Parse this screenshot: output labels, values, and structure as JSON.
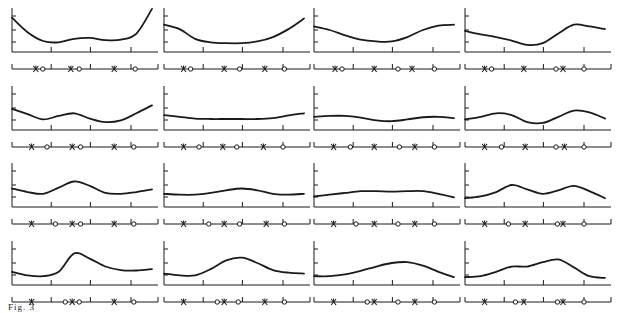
{
  "figure": {
    "caption": "Fig. 3",
    "ink_color": "#1a1a1a",
    "grid": {
      "rows": 4,
      "cols": 4
    }
  },
  "chart_data": {
    "type": "line",
    "title": "",
    "panels": [
      {
        "row": 0,
        "col": 0,
        "curve": [
          0.78,
          0.45,
          0.25,
          0.22,
          0.3,
          0.32,
          0.27,
          0.28,
          0.42,
          0.98
        ],
        "markers": [
          {
            "t": "x",
            "p": 0.17
          },
          {
            "t": "o",
            "p": 0.22
          },
          {
            "t": "x",
            "p": 0.42
          },
          {
            "t": "o",
            "p": 0.48
          },
          {
            "t": "x",
            "p": 0.73
          },
          {
            "t": "o",
            "p": 0.88
          }
        ]
      },
      {
        "row": 0,
        "col": 1,
        "curve": [
          0.62,
          0.52,
          0.3,
          0.22,
          0.2,
          0.2,
          0.24,
          0.34,
          0.52,
          0.76
        ],
        "markers": [
          {
            "t": "x",
            "p": 0.14
          },
          {
            "t": "o",
            "p": 0.19
          },
          {
            "t": "x",
            "p": 0.43
          },
          {
            "t": "o",
            "p": 0.54
          },
          {
            "t": "x",
            "p": 0.72
          },
          {
            "t": "o",
            "p": 0.86
          }
        ]
      },
      {
        "row": 0,
        "col": 2,
        "curve": [
          0.58,
          0.5,
          0.38,
          0.28,
          0.24,
          0.24,
          0.34,
          0.5,
          0.6,
          0.62
        ],
        "markers": [
          {
            "t": "x",
            "p": 0.15
          },
          {
            "t": "o",
            "p": 0.2
          },
          {
            "t": "x",
            "p": 0.43
          },
          {
            "t": "o",
            "p": 0.6
          },
          {
            "t": "x",
            "p": 0.7
          },
          {
            "t": "o",
            "p": 0.86
          }
        ]
      },
      {
        "row": 0,
        "col": 3,
        "curve": [
          0.48,
          0.4,
          0.34,
          0.26,
          0.16,
          0.2,
          0.42,
          0.62,
          0.58,
          0.52
        ],
        "markers": [
          {
            "t": "x",
            "p": 0.14
          },
          {
            "t": "o",
            "p": 0.19
          },
          {
            "t": "x",
            "p": 0.42
          },
          {
            "t": "o",
            "p": 0.65
          },
          {
            "t": "x",
            "p": 0.7
          },
          {
            "t": "o",
            "p": 0.85
          }
        ]
      },
      {
        "row": 1,
        "col": 0,
        "curve": [
          0.48,
          0.36,
          0.24,
          0.32,
          0.38,
          0.26,
          0.18,
          0.22,
          0.38,
          0.56
        ],
        "markers": [
          {
            "t": "x",
            "p": 0.14
          },
          {
            "t": "o",
            "p": 0.25
          },
          {
            "t": "x",
            "p": 0.43
          },
          {
            "t": "o",
            "p": 0.49
          },
          {
            "t": "x",
            "p": 0.73
          },
          {
            "t": "o",
            "p": 0.87
          }
        ]
      },
      {
        "row": 1,
        "col": 1,
        "curve": [
          0.34,
          0.3,
          0.26,
          0.25,
          0.25,
          0.25,
          0.25,
          0.27,
          0.33,
          0.38
        ],
        "markers": [
          {
            "t": "x",
            "p": 0.14
          },
          {
            "t": "o",
            "p": 0.25
          },
          {
            "t": "x",
            "p": 0.42
          },
          {
            "t": "o",
            "p": 0.52
          },
          {
            "t": "x",
            "p": 0.71
          },
          {
            "t": "o",
            "p": 0.85
          }
        ]
      },
      {
        "row": 1,
        "col": 2,
        "curve": [
          0.3,
          0.32,
          0.32,
          0.28,
          0.22,
          0.2,
          0.24,
          0.29,
          0.3,
          0.27
        ],
        "markers": [
          {
            "t": "x",
            "p": 0.14
          },
          {
            "t": "o",
            "p": 0.26
          },
          {
            "t": "x",
            "p": 0.43
          },
          {
            "t": "o",
            "p": 0.61
          },
          {
            "t": "x",
            "p": 0.72
          },
          {
            "t": "o",
            "p": 0.86
          }
        ]
      },
      {
        "row": 1,
        "col": 3,
        "curve": [
          0.24,
          0.3,
          0.38,
          0.34,
          0.18,
          0.16,
          0.3,
          0.44,
          0.4,
          0.26
        ],
        "markers": [
          {
            "t": "x",
            "p": 0.14
          },
          {
            "t": "o",
            "p": 0.26
          },
          {
            "t": "x",
            "p": 0.43
          },
          {
            "t": "o",
            "p": 0.65
          },
          {
            "t": "x",
            "p": 0.71
          },
          {
            "t": "o",
            "p": 0.85
          }
        ]
      },
      {
        "row": 2,
        "col": 0,
        "curve": [
          0.42,
          0.34,
          0.3,
          0.44,
          0.58,
          0.48,
          0.32,
          0.3,
          0.34,
          0.4
        ],
        "markers": [
          {
            "t": "x",
            "p": 0.14
          },
          {
            "t": "o",
            "p": 0.31
          },
          {
            "t": "x",
            "p": 0.43
          },
          {
            "t": "o",
            "p": 0.49
          },
          {
            "t": "x",
            "p": 0.73
          },
          {
            "t": "o",
            "p": 0.87
          }
        ]
      },
      {
        "row": 2,
        "col": 1,
        "curve": [
          0.3,
          0.28,
          0.28,
          0.32,
          0.38,
          0.42,
          0.38,
          0.3,
          0.28,
          0.3
        ],
        "markers": [
          {
            "t": "x",
            "p": 0.14
          },
          {
            "t": "o",
            "p": 0.32
          },
          {
            "t": "x",
            "p": 0.43
          },
          {
            "t": "o",
            "p": 0.54
          },
          {
            "t": "x",
            "p": 0.73
          },
          {
            "t": "o",
            "p": 0.86
          }
        ]
      },
      {
        "row": 2,
        "col": 2,
        "curve": [
          0.24,
          0.28,
          0.32,
          0.36,
          0.36,
          0.35,
          0.36,
          0.36,
          0.3,
          0.22
        ],
        "markers": [
          {
            "t": "x",
            "p": 0.14
          },
          {
            "t": "o",
            "p": 0.3
          },
          {
            "t": "x",
            "p": 0.43
          },
          {
            "t": "o",
            "p": 0.6
          },
          {
            "t": "x",
            "p": 0.72
          },
          {
            "t": "o",
            "p": 0.86
          }
        ]
      },
      {
        "row": 2,
        "col": 3,
        "curve": [
          0.2,
          0.24,
          0.34,
          0.5,
          0.4,
          0.3,
          0.38,
          0.48,
          0.36,
          0.2
        ],
        "markers": [
          {
            "t": "x",
            "p": 0.14
          },
          {
            "t": "o",
            "p": 0.31
          },
          {
            "t": "x",
            "p": 0.43
          },
          {
            "t": "o",
            "p": 0.66
          },
          {
            "t": "x",
            "p": 0.7
          },
          {
            "t": "o",
            "p": 0.85
          }
        ]
      },
      {
        "row": 3,
        "col": 0,
        "curve": [
          0.3,
          0.22,
          0.2,
          0.3,
          0.72,
          0.6,
          0.42,
          0.34,
          0.33,
          0.36
        ],
        "markers": [
          {
            "t": "x",
            "p": 0.14
          },
          {
            "t": "o",
            "p": 0.38
          },
          {
            "t": "x",
            "p": 0.43
          },
          {
            "t": "o",
            "p": 0.48
          },
          {
            "t": "x",
            "p": 0.73
          },
          {
            "t": "o",
            "p": 0.87
          }
        ]
      },
      {
        "row": 3,
        "col": 1,
        "curve": [
          0.26,
          0.22,
          0.22,
          0.36,
          0.56,
          0.62,
          0.5,
          0.34,
          0.28,
          0.26
        ],
        "markers": [
          {
            "t": "x",
            "p": 0.14
          },
          {
            "t": "o",
            "p": 0.38
          },
          {
            "t": "x",
            "p": 0.43
          },
          {
            "t": "o",
            "p": 0.53
          },
          {
            "t": "x",
            "p": 0.72
          },
          {
            "t": "o",
            "p": 0.86
          }
        ]
      },
      {
        "row": 3,
        "col": 2,
        "curve": [
          0.2,
          0.2,
          0.24,
          0.32,
          0.42,
          0.5,
          0.52,
          0.44,
          0.3,
          0.18
        ],
        "markers": [
          {
            "t": "x",
            "p": 0.14
          },
          {
            "t": "o",
            "p": 0.38
          },
          {
            "t": "x",
            "p": 0.43
          },
          {
            "t": "o",
            "p": 0.6
          },
          {
            "t": "x",
            "p": 0.72
          },
          {
            "t": "o",
            "p": 0.86
          }
        ]
      },
      {
        "row": 3,
        "col": 3,
        "curve": [
          0.18,
          0.2,
          0.3,
          0.42,
          0.42,
          0.52,
          0.58,
          0.4,
          0.2,
          0.16
        ],
        "markers": [
          {
            "t": "x",
            "p": 0.14
          },
          {
            "t": "o",
            "p": 0.36
          },
          {
            "t": "x",
            "p": 0.42
          },
          {
            "t": "o",
            "p": 0.66
          },
          {
            "t": "x",
            "p": 0.7
          },
          {
            "t": "o",
            "p": 0.85
          }
        ]
      }
    ],
    "xlabel": "",
    "ylabel": "",
    "axis_ticks": {
      "x": 3,
      "y": 3
    },
    "legend": null
  }
}
